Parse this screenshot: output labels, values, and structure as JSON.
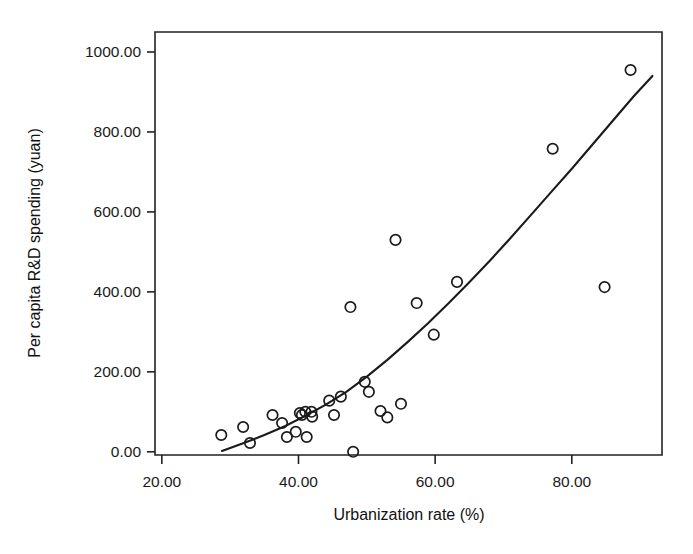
{
  "chart_data": {
    "type": "scatter",
    "title": "",
    "subtitle": "",
    "xlabel": "Urbanization rate (%)",
    "ylabel": "Per capita R&D spending (yuan)",
    "xlim": [
      19.0,
      93.2
    ],
    "ylim": [
      -8.0,
      1050.0
    ],
    "grid": false,
    "legend": null,
    "xticks": [
      20.0,
      40.0,
      60.0,
      80.0
    ],
    "xtick_labels": [
      "20.00",
      "40.00",
      "60.00",
      "80.00"
    ],
    "yticks": [
      0.0,
      200.0,
      400.0,
      600.0,
      800.0,
      1000.0
    ],
    "ytick_labels": [
      "0.00",
      "200.00",
      "400.00",
      "600.00",
      "800.00",
      "1000.00"
    ],
    "marker": "open-circle",
    "marker_color": "#1a1a1a",
    "points": [
      {
        "x": 28.7,
        "y": 42
      },
      {
        "x": 31.9,
        "y": 62
      },
      {
        "x": 32.9,
        "y": 22
      },
      {
        "x": 36.2,
        "y": 92
      },
      {
        "x": 37.6,
        "y": 72
      },
      {
        "x": 38.3,
        "y": 37
      },
      {
        "x": 39.6,
        "y": 50
      },
      {
        "x": 40.2,
        "y": 97
      },
      {
        "x": 40.5,
        "y": 92
      },
      {
        "x": 41.0,
        "y": 100
      },
      {
        "x": 41.2,
        "y": 37
      },
      {
        "x": 41.9,
        "y": 100
      },
      {
        "x": 42.0,
        "y": 88
      },
      {
        "x": 44.5,
        "y": 128
      },
      {
        "x": 45.2,
        "y": 92
      },
      {
        "x": 46.2,
        "y": 138
      },
      {
        "x": 47.6,
        "y": 362
      },
      {
        "x": 48.0,
        "y": 0
      },
      {
        "x": 49.7,
        "y": 175
      },
      {
        "x": 50.3,
        "y": 150
      },
      {
        "x": 52.0,
        "y": 102
      },
      {
        "x": 53.0,
        "y": 86
      },
      {
        "x": 54.2,
        "y": 530
      },
      {
        "x": 55.0,
        "y": 120
      },
      {
        "x": 57.3,
        "y": 372
      },
      {
        "x": 59.8,
        "y": 293
      },
      {
        "x": 63.2,
        "y": 425
      },
      {
        "x": 77.2,
        "y": 758
      },
      {
        "x": 84.8,
        "y": 412
      },
      {
        "x": 88.6,
        "y": 955
      }
    ],
    "fit_curve": {
      "name": "quadratic fit",
      "x": [
        28.8,
        32.0,
        35.0,
        38.0,
        41.0,
        44.0,
        47.0,
        50.0,
        53.0,
        56.0,
        59.0,
        62.0,
        65.0,
        68.0,
        71.0,
        74.0,
        77.0,
        80.0,
        83.0,
        86.0,
        89.0,
        91.8
      ],
      "y": [
        2,
        22,
        42,
        64,
        90,
        118,
        150,
        188,
        230,
        275,
        322,
        372,
        424,
        478,
        534,
        592,
        650,
        708,
        768,
        828,
        888,
        940
      ]
    }
  },
  "axes": {
    "x_title": "Urbanization rate (%)",
    "y_title": "Per capita R&D spending (yuan)"
  }
}
